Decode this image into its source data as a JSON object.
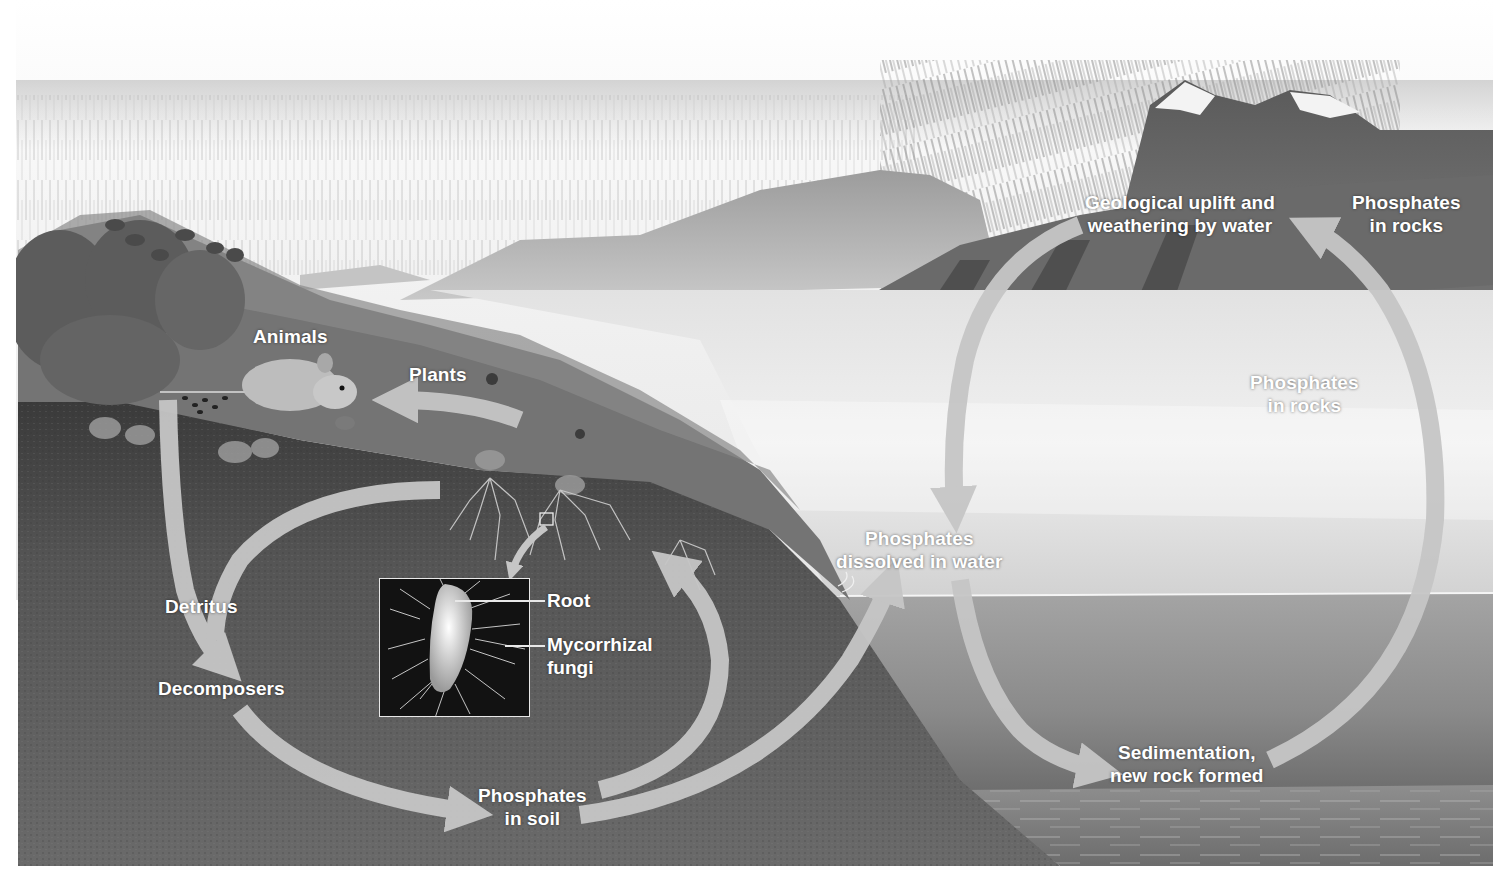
{
  "diagram": {
    "style": "grayscale illustration",
    "colors": {
      "sky": "#f4f4f4",
      "rain": "#9a9a9a",
      "soil": "#5a5a5a",
      "soil_dark": "#3e3e3e",
      "grass": "#6e6e6e",
      "water_surface": "#d8d8d8",
      "water_deep": "#8c8c8c",
      "arrow": "#c4c4c4",
      "label_text": "#ffffff",
      "mountain": "#8a8a8a"
    }
  },
  "labels": {
    "animals": "Animals",
    "plants": "Plants",
    "detritus": "Detritus",
    "decomposers": "Decomposers",
    "phosphates_in_soil": [
      "Phosphates",
      "in soil"
    ],
    "phosphates_dissolved": [
      "Phosphates",
      "dissolved in water"
    ],
    "geological_uplift": [
      "Geological uplift and",
      "weathering by water"
    ],
    "phosphates_in_rocks_top": [
      "Phosphates",
      "in rocks"
    ],
    "phosphates_in_rocks_mid": [
      "Phosphates",
      "in rocks"
    ],
    "sedimentation": [
      "Sedimentation,",
      "new rock formed"
    ]
  },
  "inset": {
    "callouts": {
      "root": "Root",
      "mycorrhizal_fungi": [
        "Mycorrhizal",
        "fungi"
      ]
    }
  },
  "nodes": [
    {
      "id": "plants",
      "label": "Plants"
    },
    {
      "id": "animals",
      "label": "Animals"
    },
    {
      "id": "detritus",
      "label": "Detritus"
    },
    {
      "id": "decomposers",
      "label": "Decomposers"
    },
    {
      "id": "phosphates_in_soil",
      "label": "Phosphates in soil"
    },
    {
      "id": "phosphates_dissolved",
      "label": "Phosphates dissolved in water"
    },
    {
      "id": "sedimentation",
      "label": "Sedimentation, new rock formed"
    },
    {
      "id": "phosphates_in_rocks",
      "label": "Phosphates in rocks"
    },
    {
      "id": "geological_uplift",
      "label": "Geological uplift and weathering by water"
    }
  ],
  "edges": [
    {
      "from": "plants",
      "to": "animals"
    },
    {
      "from": "animals",
      "to": "detritus"
    },
    {
      "from": "detritus",
      "to": "decomposers"
    },
    {
      "from": "decomposers",
      "to": "phosphates_in_soil"
    },
    {
      "from": "phosphates_in_soil",
      "to": "plants",
      "via": "roots / mycorrhizal fungi"
    },
    {
      "from": "phosphates_in_soil",
      "to": "phosphates_dissolved"
    },
    {
      "from": "geological_uplift",
      "to": "phosphates_dissolved"
    },
    {
      "from": "phosphates_dissolved",
      "to": "sedimentation"
    },
    {
      "from": "sedimentation",
      "to": "geological_uplift"
    }
  ]
}
